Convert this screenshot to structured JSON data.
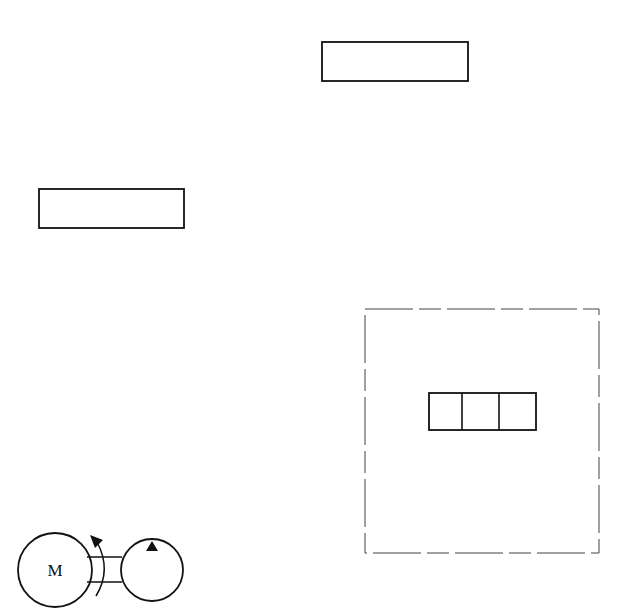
{
  "diagram": {
    "type": "hydraulic-schematic",
    "stroke_color": "#111111",
    "background": "#ffffff",
    "components": [
      {
        "id": "block-top",
        "kind": "rectangle",
        "x": 322,
        "y": 42,
        "w": 146,
        "h": 39
      },
      {
        "id": "block-left",
        "kind": "rectangle",
        "x": 39,
        "y": 189,
        "w": 145,
        "h": 39
      },
      {
        "id": "dashed-enclosure",
        "kind": "dashed-rectangle",
        "x": 365,
        "y": 309,
        "w": 234,
        "h": 244
      },
      {
        "id": "three-position-valve",
        "kind": "valve-3-cell",
        "x": 429,
        "y": 393,
        "w": 107,
        "h": 37,
        "cells": 3
      },
      {
        "id": "electric-motor",
        "kind": "motor",
        "cx": 55,
        "cy": 570,
        "r": 37
      },
      {
        "id": "coupling",
        "kind": "shaft-coupling"
      },
      {
        "id": "pump",
        "kind": "pump",
        "cx": 152,
        "cy": 570,
        "r": 31
      }
    ],
    "motor": {
      "label": "M"
    },
    "pump_indicator": "filled-triangle",
    "rotation_arrow": "curved-arrow"
  }
}
